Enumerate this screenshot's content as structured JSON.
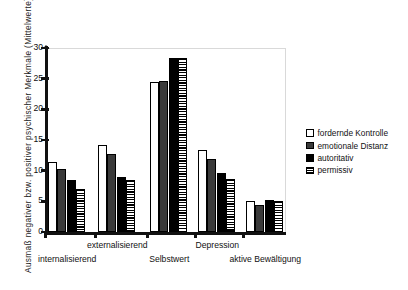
{
  "chart_data": {
    "type": "bar",
    "title": "",
    "xlabel": "",
    "ylabel": "Ausmaß negativer bzw. positiver psychischer Merkmale (Mittelwerte)",
    "ylim": [
      0,
      30
    ],
    "yticks": [
      "0",
      "5",
      "10",
      "15",
      "20",
      "25",
      "30"
    ],
    "grid": false,
    "legend_position": "right",
    "categories": [
      "internalisierend",
      "externalisierend",
      "Selbstwert",
      "Depression",
      "aktive Bewältigung"
    ],
    "series": [
      {
        "name": "fordernde Kontrolle",
        "color": "#ffffff",
        "pattern": "outline",
        "values": [
          11.4,
          14.2,
          24.4,
          13.4,
          5.0
        ]
      },
      {
        "name": "emotionale Distanz",
        "color": "#3a3a3a",
        "pattern": "solid",
        "values": [
          10.2,
          12.7,
          24.7,
          11.9,
          4.4
        ]
      },
      {
        "name": "autoritativ",
        "color": "#000000",
        "pattern": "solid",
        "values": [
          8.5,
          9.0,
          28.3,
          9.7,
          5.2
        ]
      },
      {
        "name": "permissiv",
        "color": "#ffffff",
        "pattern": "hatched",
        "values": [
          7.0,
          8.4,
          28.4,
          8.6,
          5.1
        ]
      }
    ]
  },
  "axis": {
    "y_title": "Ausmaß negativer bzw. positiver psychischer Merkmale (Mittelwerte)",
    "y_labels": [
      "30",
      "25",
      "20",
      "15",
      "10",
      "5",
      "0"
    ]
  },
  "legend": {
    "items": [
      {
        "label": "fordernde Kontrolle"
      },
      {
        "label": "emotionale Distanz"
      },
      {
        "label": "autoritativ"
      },
      {
        "label": "permissiv"
      }
    ]
  }
}
